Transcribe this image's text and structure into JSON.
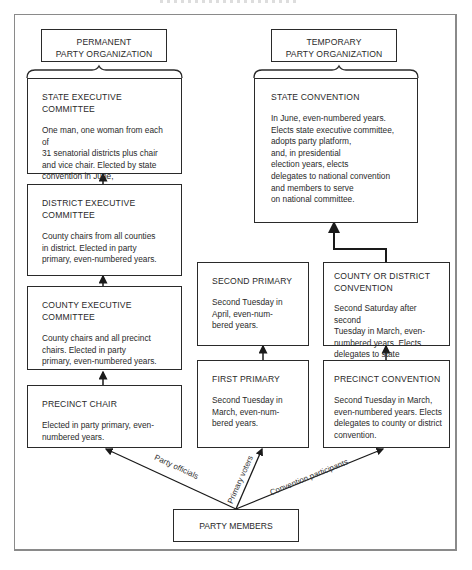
{
  "permanent": {
    "header": "PERMANENT\nPARTY ORGANIZATION",
    "boxes": [
      {
        "title": "STATE EXECUTIVE COMMITTEE",
        "body": "One man, one woman from each of\n31 senatorial districts plus chair\nand vice chair. Elected by state\nconvention in June,\neven-numbered years."
      },
      {
        "title": "DISTRICT EXECUTIVE\nCOMMITTEE",
        "body": "County chairs from all counties\nin district. Elected in party\nprimary, even-numbered years."
      },
      {
        "title": "COUNTY EXECUTIVE\nCOMMITTEE",
        "body": "County chairs and all precinct\nchairs. Elected in party\nprimary, even-numbered years."
      },
      {
        "title": "PRECINCT CHAIR",
        "body": "Elected in party primary, even-\nnumbered years."
      }
    ]
  },
  "temporary": {
    "header": "TEMPORARY\nPARTY ORGANIZATION",
    "state_convention": {
      "title": "STATE CONVENTION",
      "body": "In June, even-numbered years.\nElects state executive committee,\nadopts party platform,\nand, in presidential\nelection years, elects\ndelegates to national convention\nand members to serve\non national committee."
    },
    "county_convention": {
      "title": "COUNTY OR DISTRICT\nCONVENTION",
      "body": "Second Saturday after second\nTuesday in March, even-\nnumbered years. Elects\ndelegates to state convention."
    },
    "precinct_convention": {
      "title": "PRECINCT CONVENTION",
      "body": "Second Tuesday in March,\neven-numbered years. Elects\ndelegates to county or district\nconvention."
    }
  },
  "primaries": {
    "second": {
      "title": "SECOND PRIMARY",
      "body": "Second Tuesday in\nApril, even-num-\nbered years."
    },
    "first": {
      "title": "FIRST PRIMARY",
      "body": "Second Tuesday in\nMarch, even-num-\nbered years."
    }
  },
  "party_members": "PARTY MEMBERS",
  "arrow_labels": {
    "officials": "Party officials",
    "voters": "Primary voters",
    "participants": "Convention participants"
  }
}
